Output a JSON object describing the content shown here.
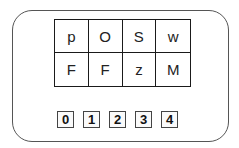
{
  "grid": {
    "rows": [
      [
        "p",
        "O",
        "S",
        "w"
      ],
      [
        "F",
        "F",
        "z",
        "M"
      ]
    ]
  },
  "buttons": [
    "0",
    "1",
    "2",
    "3",
    "4"
  ],
  "colors": {
    "grid_border": "#1a1a1a",
    "card_border": "#555555",
    "button_border": "#444444",
    "background": "#ffffff"
  }
}
